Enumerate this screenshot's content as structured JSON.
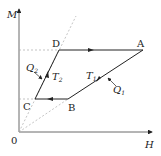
{
  "diagram": {
    "axes": {
      "y_label": "M",
      "x_label": "H",
      "origin_label": "0"
    },
    "points": {
      "A": "A",
      "B": "B",
      "C": "C",
      "D": "D"
    },
    "annotations": {
      "Q1": {
        "main": "Q",
        "sub": "1"
      },
      "Q2": {
        "main": "Q",
        "sub": "2"
      },
      "T1": {
        "main": "T",
        "sub": "1"
      },
      "T2": {
        "main": "T",
        "sub": "2"
      }
    },
    "colors": {
      "line": "#222222",
      "dashed": "#999999"
    }
  }
}
